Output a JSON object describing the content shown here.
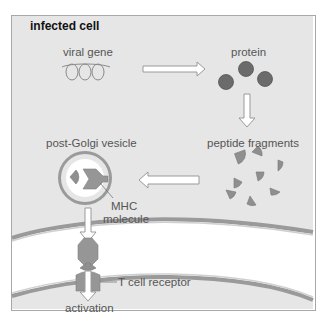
{
  "title": "infected cell",
  "labels": {
    "viral_gene": "viral gene",
    "protein": "protein",
    "peptide_fragments": "peptide fragments",
    "post_golgi_vesicle": "post-Golgi vesicle",
    "mhc_line1": "MHC",
    "mhc_line2": "molecule",
    "t_cell_receptor": "T cell receptor",
    "activation": "activation"
  },
  "colors": {
    "cell_fill": "#e6e6e6",
    "membrane": "#9a9a9a",
    "protein_dot": "#6b6b6b",
    "fragment": "#8f8f8f",
    "mhc": "#969696",
    "arrow_fill": "#ffffff",
    "arrow_stroke": "#9a9a9a"
  }
}
